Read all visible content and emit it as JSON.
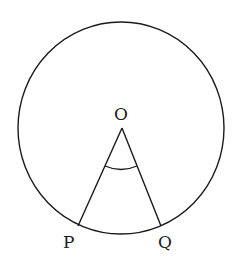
{
  "diagram": {
    "type": "circle-central-angle",
    "labels": {
      "center": "O",
      "point_left": "P",
      "point_right": "Q"
    },
    "elements": [
      "circle",
      "radius OP",
      "radius OQ",
      "angle arc at O"
    ],
    "colors": {
      "stroke": "#1a1a1a",
      "background": "#ffffff"
    }
  }
}
